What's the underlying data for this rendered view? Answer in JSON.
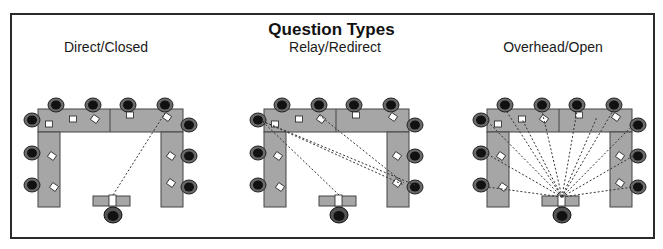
{
  "figure": {
    "title": "Question Types",
    "panels": [
      {
        "label": "Direct/Closed",
        "pattern": "single-line",
        "lines": 1
      },
      {
        "label": "Relay/Redirect",
        "pattern": "relay-chain",
        "lines": 4
      },
      {
        "label": "Overhead/Open",
        "pattern": "fan-out",
        "lines": 12
      }
    ],
    "colors": {
      "frame": "#2a2a2a",
      "table": "#a6a6a6",
      "table_edge": "#444444",
      "chair": "#3a3a3a",
      "chair_dark": "#111111",
      "paper": "#ffffff",
      "dash": "#333333"
    }
  }
}
